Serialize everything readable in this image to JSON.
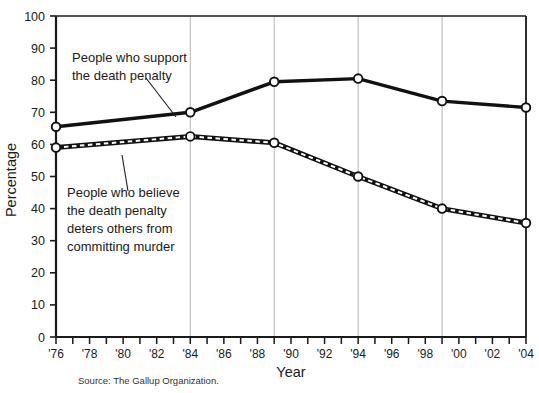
{
  "chart_data": {
    "type": "line",
    "title": "",
    "xlabel": "Year",
    "ylabel": "Percentage",
    "ylim": [
      0,
      100
    ],
    "ytick_step": 10,
    "yticks": [
      "0",
      "10",
      "20",
      "30",
      "40",
      "50",
      "60",
      "70",
      "80",
      "90",
      "100"
    ],
    "xlim": [
      1976,
      2004
    ],
    "xticks": [
      "'76",
      "'77",
      "'78",
      "'79",
      "'80",
      "'81",
      "'82",
      "'83",
      "'84",
      "'85",
      "'86",
      "'87",
      "'88",
      "'89",
      "'90",
      "'91",
      "'92",
      "'93",
      "'94",
      "'95",
      "'96",
      "'97",
      "'98",
      "'99",
      "'00",
      "'01",
      "'02",
      "'03",
      "'04"
    ],
    "xtick_labels_shown": [
      "'76",
      "'78",
      "'80",
      "'82",
      "'84",
      "'86",
      "'88",
      "'90",
      "'92",
      "'94",
      "'96",
      "'98",
      "'00",
      "'02",
      "'04"
    ],
    "grid": "vertical-at-data-years",
    "gridline_years": [
      1984,
      1989,
      1994,
      1999,
      2004
    ],
    "legend": "inline-annotations",
    "x": [
      1976,
      1984,
      1989,
      1994,
      1999,
      2004
    ],
    "series": [
      {
        "name": "People who support the death penalty",
        "style": "solid-thick",
        "values": [
          65.5,
          70,
          79.5,
          80.5,
          73.5,
          71.5
        ]
      },
      {
        "name": "People who believe the death penalty deters others from committing murder",
        "style": "dashed-thick",
        "values": [
          59,
          62.5,
          60.5,
          50,
          40,
          35.5
        ]
      }
    ],
    "annotations": [
      {
        "id": "support-annotation",
        "lines": [
          "People who support",
          "the death penalty"
        ]
      },
      {
        "id": "deterrence-annotation",
        "lines": [
          "People who believe",
          "the death penalty",
          "deters others from",
          "committing murder"
        ]
      }
    ],
    "source": "Source: The Gallup Organization.",
    "colors": {
      "line": "#111111",
      "axis": "#1a1a1a",
      "grid": "#b4b4b4",
      "marker_fill": "#ffffff",
      "background": "#ffffff"
    }
  }
}
